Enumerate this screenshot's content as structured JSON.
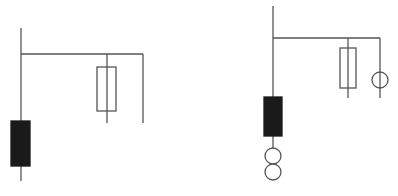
{
  "diagram": {
    "width": 398,
    "height": 196,
    "background": "#ffffff",
    "stroke": "#555555",
    "fill_dark": "#1a1a1a",
    "left_circuit": {
      "main_line": {
        "x": 21,
        "y1": 28,
        "y2": 181
      },
      "bus": {
        "y": 54,
        "x1": 21,
        "x2": 143
      },
      "branch_fuse": {
        "x": 107,
        "y1": 54,
        "y2": 123,
        "rect": {
          "x": 97,
          "y": 67,
          "w": 19,
          "h": 44
        }
      },
      "branch_plain": {
        "x": 143,
        "y1": 54,
        "y2": 123
      },
      "dark_block": {
        "x": 11,
        "y": 121,
        "w": 19,
        "h": 45
      }
    },
    "right_circuit": {
      "main_line": {
        "x": 273,
        "y1": 6,
        "y2": 148
      },
      "bus": {
        "y": 38,
        "x1": 273,
        "x2": 380
      },
      "branch_fuse": {
        "x": 348,
        "y1": 38,
        "y2": 98,
        "rect": {
          "x": 340,
          "y": 48,
          "w": 16,
          "h": 40
        }
      },
      "branch_meter": {
        "x": 380,
        "y1": 38,
        "y2": 98,
        "circle": {
          "cx": 380,
          "cy": 80,
          "r": 8
        }
      },
      "dark_block": {
        "x": 264,
        "y": 97,
        "w": 18,
        "h": 39
      },
      "transformer_coils": [
        {
          "cx": 273,
          "cy": 156,
          "r": 8
        },
        {
          "cx": 273,
          "cy": 172,
          "r": 8
        }
      ]
    }
  }
}
